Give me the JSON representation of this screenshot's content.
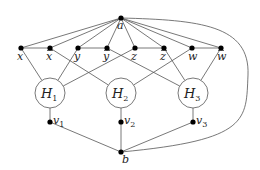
{
  "diagram": {
    "type": "graph",
    "apex": {
      "id": "a",
      "label": "a",
      "x": 121,
      "y": 18
    },
    "bottom": {
      "id": "b",
      "label": "b",
      "x": 121,
      "y": 152
    },
    "literals": [
      {
        "id": "x",
        "label": "x",
        "bar": false,
        "x": 21,
        "y": 48
      },
      {
        "id": "xb",
        "label": "x",
        "bar": true,
        "x": 50,
        "y": 48
      },
      {
        "id": "y",
        "label": "y",
        "bar": false,
        "x": 78,
        "y": 48
      },
      {
        "id": "yb",
        "label": "y",
        "bar": true,
        "x": 107,
        "y": 48
      },
      {
        "id": "z",
        "label": "z",
        "bar": false,
        "x": 135,
        "y": 48
      },
      {
        "id": "zb",
        "label": "z",
        "bar": true,
        "x": 164,
        "y": 48
      },
      {
        "id": "w",
        "label": "w",
        "bar": false,
        "x": 192,
        "y": 48
      },
      {
        "id": "wb",
        "label": "w",
        "bar": true,
        "x": 221,
        "y": 48
      }
    ],
    "gadgets": [
      {
        "id": "H1",
        "label": "H",
        "sub": "1",
        "x": 50,
        "y": 93,
        "r": 15
      },
      {
        "id": "H2",
        "label": "H",
        "sub": "2",
        "x": 121,
        "y": 93,
        "r": 15
      },
      {
        "id": "H3",
        "label": "H",
        "sub": "3",
        "x": 193,
        "y": 93,
        "r": 15
      }
    ],
    "connectors": [
      {
        "id": "v1",
        "label": "v",
        "sub": "1",
        "x": 50,
        "y": 122
      },
      {
        "id": "v2",
        "label": "v",
        "sub": "2",
        "x": 121,
        "y": 122
      },
      {
        "id": "v3",
        "label": "v",
        "sub": "3",
        "x": 193,
        "y": 122
      }
    ],
    "pair_edges": [
      [
        "x",
        "xb"
      ],
      [
        "y",
        "yb"
      ],
      [
        "z",
        "zb"
      ],
      [
        "w",
        "wb"
      ]
    ],
    "literal_to_gadget": [
      [
        "x",
        "H1"
      ],
      [
        "y",
        "H1"
      ],
      [
        "z",
        "H1"
      ],
      [
        "xb",
        "H2"
      ],
      [
        "w",
        "H2"
      ],
      [
        "yb",
        "H3"
      ],
      [
        "zb",
        "H3"
      ],
      [
        "wb",
        "H3"
      ]
    ],
    "curved_edge": {
      "from": "a",
      "to": "b",
      "side": "right"
    }
  }
}
